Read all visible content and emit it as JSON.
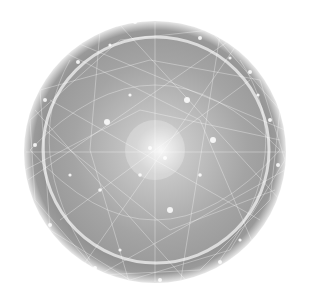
{
  "image": {
    "subject": "network-sphere",
    "description": "Abstract glowing sphere composed of interconnected lines and nodes",
    "colors": {
      "background": "#ffffff",
      "outer_shell": "#8a8a8a",
      "inner_sphere": "#a8a8a8",
      "highlight": "#f4f4f4",
      "lines": "#ffffff"
    }
  }
}
